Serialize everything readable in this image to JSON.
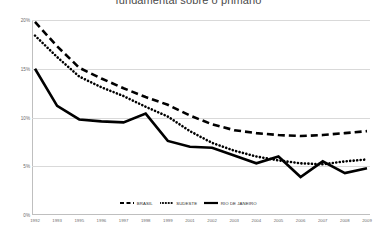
{
  "chart_title": "fundamental sobre o primário",
  "axis": {
    "y_ticks": [
      "20%",
      "15%",
      "10%",
      "5%",
      "0%"
    ],
    "y_values": [
      20,
      15,
      10,
      5,
      0
    ],
    "x_ticks": [
      "1992",
      "1993",
      "1995",
      "1996",
      "1997",
      "1998",
      "1999",
      "2001",
      "2002",
      "2003",
      "2004",
      "2005",
      "2006",
      "2007",
      "2008",
      "2009"
    ]
  },
  "legend": [
    {
      "label": "BRASIL",
      "style": "dashed",
      "color": "#000000"
    },
    {
      "label": "SUDESTE",
      "style": "dotted",
      "color": "#000000"
    },
    {
      "label": "RIO DE JANEIRO",
      "style": "solid",
      "color": "#000000"
    }
  ],
  "colors": {
    "grid": "#d9d9d9",
    "axis": "#bfbfbf",
    "text": "#6b6b6b",
    "series": "#000000"
  },
  "chart_data": {
    "type": "line",
    "title": "fundamental sobre o primário",
    "xlabel": "",
    "ylabel": "",
    "ylim": [
      0,
      20
    ],
    "grid": true,
    "legend_position": "bottom",
    "categories": [
      "1992",
      "1993",
      "1995",
      "1996",
      "1997",
      "1998",
      "1999",
      "2001",
      "2002",
      "2003",
      "2004",
      "2005",
      "2006",
      "2007",
      "2008",
      "2009"
    ],
    "series": [
      {
        "name": "BRASIL",
        "style": "dashed",
        "values": [
          19.8,
          17.3,
          15.1,
          14.0,
          13.0,
          12.1,
          11.3,
          10.2,
          9.3,
          8.7,
          8.4,
          8.2,
          8.1,
          8.2,
          8.4,
          8.6
        ]
      },
      {
        "name": "SUDESTE",
        "style": "dotted",
        "values": [
          18.4,
          16.2,
          14.2,
          13.1,
          12.2,
          11.1,
          10.1,
          8.6,
          7.4,
          6.6,
          6.0,
          5.6,
          5.3,
          5.2,
          5.5,
          5.7
        ]
      },
      {
        "name": "RIO DE JANEIRO",
        "style": "solid",
        "values": [
          15.0,
          11.2,
          9.8,
          9.6,
          9.5,
          10.4,
          7.6,
          7.0,
          6.9,
          6.1,
          5.3,
          6.0,
          3.9,
          5.5,
          4.3,
          4.8
        ]
      }
    ]
  }
}
